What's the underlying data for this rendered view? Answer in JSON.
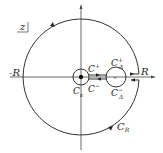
{
  "diagram": {
    "plane_label": "z",
    "labels": {
      "neg_R": "-R",
      "pos_R": "R",
      "C_plus": "C",
      "C_plus_sup": "+",
      "C_minus": "C",
      "C_minus_sup": "−",
      "C_eps": "C",
      "C_eps_sub": "ε",
      "C_delta_plus": "C",
      "C_delta_plus_sup": "+",
      "C_delta_plus_sub": "Δ",
      "C_delta_minus": "C",
      "C_delta_minus_sup": "−",
      "C_delta_minus_sub": "Δ",
      "C_R": "C",
      "C_R_sub": "R"
    },
    "colors": {
      "stroke": "#333333"
    }
  }
}
